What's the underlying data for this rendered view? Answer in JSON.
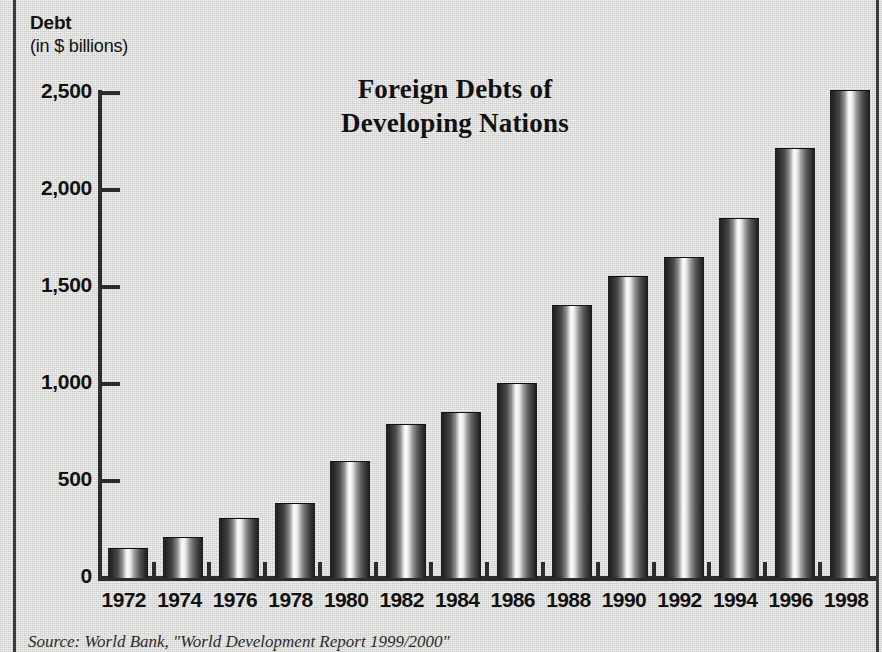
{
  "axis_title": {
    "line1": "Debt",
    "line2": "(in $ billions)"
  },
  "title": {
    "line1": "Foreign Debts of",
    "line2": "Developing Nations"
  },
  "source_note": "Source: World Bank, \"World Development Report 1999/2000\"",
  "colors": {
    "background": "#e9e9e7",
    "ink": "#111111",
    "axis": "#2c2c2c",
    "frame": "#3a3a3a",
    "bar_dark": "#1e1e1e",
    "bar_highlight": "#fbfbfb"
  },
  "chart_data": {
    "type": "bar",
    "title": "Foreign Debts of Developing Nations",
    "xlabel": "",
    "ylabel": "Debt (in $ billions)",
    "ylim": [
      0,
      2500
    ],
    "yticks": [
      0,
      500,
      1000,
      1500,
      2000,
      2500
    ],
    "ytick_labels": [
      "0",
      "500",
      "1,000",
      "1,500",
      "2,000",
      "2,500"
    ],
    "grid": false,
    "legend": "none",
    "categories": [
      "1972",
      "1974",
      "1976",
      "1978",
      "1980",
      "1982",
      "1984",
      "1986",
      "1988",
      "1990",
      "1992",
      "1994",
      "1996",
      "1998"
    ],
    "values": [
      150,
      205,
      305,
      380,
      600,
      790,
      850,
      1000,
      1400,
      1550,
      1650,
      1850,
      2210,
      2510
    ]
  }
}
